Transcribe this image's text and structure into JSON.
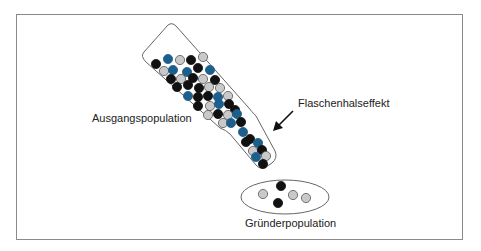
{
  "labels": {
    "source": "Ausgangspopulation",
    "effect": "Flaschenhalseffekt",
    "founder": "Gründerpopulation"
  },
  "colors": {
    "black": "#111111",
    "blue": "#1d5f8c",
    "gray": "#c9c9c9",
    "outline": "#555555",
    "frame": "#8a8a8a"
  },
  "bottle_dots": [
    {
      "x": 156,
      "y": 64,
      "c": "black"
    },
    {
      "x": 168,
      "y": 59,
      "c": "blue"
    },
    {
      "x": 180,
      "y": 60,
      "c": "gray"
    },
    {
      "x": 191,
      "y": 60,
      "c": "black"
    },
    {
      "x": 203,
      "y": 57,
      "c": "gray"
    },
    {
      "x": 164,
      "y": 71,
      "c": "gray"
    },
    {
      "x": 173,
      "y": 70,
      "c": "blue"
    },
    {
      "x": 187,
      "y": 72,
      "c": "blue"
    },
    {
      "x": 198,
      "y": 68,
      "c": "black"
    },
    {
      "x": 210,
      "y": 70,
      "c": "blue"
    },
    {
      "x": 171,
      "y": 79,
      "c": "black"
    },
    {
      "x": 181,
      "y": 79,
      "c": "gray"
    },
    {
      "x": 193,
      "y": 78,
      "c": "black"
    },
    {
      "x": 203,
      "y": 79,
      "c": "gray"
    },
    {
      "x": 215,
      "y": 80,
      "c": "black"
    },
    {
      "x": 177,
      "y": 87,
      "c": "black"
    },
    {
      "x": 188,
      "y": 85,
      "c": "black"
    },
    {
      "x": 199,
      "y": 88,
      "c": "black"
    },
    {
      "x": 209,
      "y": 87,
      "c": "gray"
    },
    {
      "x": 220,
      "y": 88,
      "c": "gray"
    },
    {
      "x": 188,
      "y": 96,
      "c": "blue"
    },
    {
      "x": 198,
      "y": 97,
      "c": "black"
    },
    {
      "x": 208,
      "y": 96,
      "c": "black"
    },
    {
      "x": 218,
      "y": 97,
      "c": "blue"
    },
    {
      "x": 228,
      "y": 96,
      "c": "gray"
    },
    {
      "x": 198,
      "y": 106,
      "c": "black"
    },
    {
      "x": 210,
      "y": 106,
      "c": "gray"
    },
    {
      "x": 219,
      "y": 104,
      "c": "blue"
    },
    {
      "x": 229,
      "y": 104,
      "c": "black"
    },
    {
      "x": 235,
      "y": 110,
      "c": "black"
    },
    {
      "x": 208,
      "y": 115,
      "c": "gray"
    },
    {
      "x": 218,
      "y": 114,
      "c": "black"
    },
    {
      "x": 228,
      "y": 115,
      "c": "gray"
    },
    {
      "x": 237,
      "y": 114,
      "c": "blue"
    },
    {
      "x": 223,
      "y": 123,
      "c": "gray"
    },
    {
      "x": 231,
      "y": 123,
      "c": "blue"
    },
    {
      "x": 241,
      "y": 122,
      "c": "black"
    },
    {
      "x": 243,
      "y": 132,
      "c": "blue"
    },
    {
      "x": 250,
      "y": 139,
      "c": "black"
    },
    {
      "x": 246,
      "y": 142,
      "c": "black"
    },
    {
      "x": 258,
      "y": 143,
      "c": "blue"
    },
    {
      "x": 253,
      "y": 151,
      "c": "gray"
    },
    {
      "x": 262,
      "y": 150,
      "c": "black"
    },
    {
      "x": 256,
      "y": 157,
      "c": "blue"
    },
    {
      "x": 266,
      "y": 156,
      "c": "gray"
    },
    {
      "x": 263,
      "y": 164,
      "c": "black"
    }
  ],
  "founder_dots": [
    {
      "x": 263,
      "y": 194,
      "c": "gray"
    },
    {
      "x": 281,
      "y": 186,
      "c": "black"
    },
    {
      "x": 278,
      "y": 203,
      "c": "black"
    },
    {
      "x": 293,
      "y": 195,
      "c": "gray"
    },
    {
      "x": 306,
      "y": 198,
      "c": "gray"
    }
  ]
}
